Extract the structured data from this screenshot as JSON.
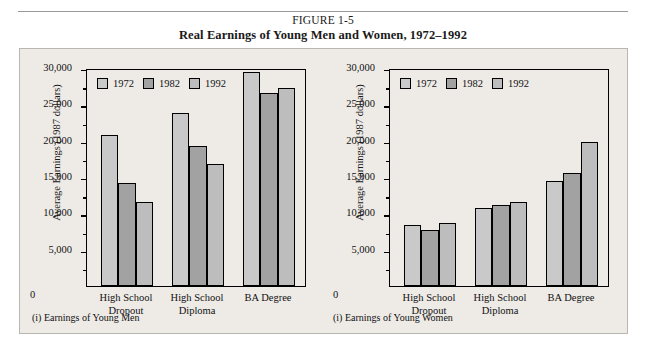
{
  "figure": {
    "number": "FIGURE 1-5",
    "title": "Real Earnings of Young Men and Women, 1972–1992"
  },
  "colors": {
    "panel_background": "#eeebe7",
    "panel_border": "#b9b5b0",
    "series_1972": "#c9c9c9",
    "series_1982": "#a2a2a2",
    "series_1992": "#bdbdbd",
    "axis": "#000000",
    "text": "#111111"
  },
  "axis": {
    "y_label": "Average Earnings (1987 dollars)",
    "zero_label": "0",
    "tick_labels": [
      "30,000",
      "25,000",
      "20,000",
      "15,000",
      "10,000",
      "5,000"
    ],
    "tick_values": [
      30000,
      25000,
      20000,
      15000,
      10000,
      5000
    ],
    "minor_tick_values": [
      27500,
      22500,
      17500,
      12500,
      7500,
      2500
    ]
  },
  "legend": {
    "entries": [
      {
        "label": "1972",
        "color": "#c9c9c9"
      },
      {
        "label": "1982",
        "color": "#a2a2a2"
      },
      {
        "label": "1992",
        "color": "#bdbdbd"
      }
    ]
  },
  "categories": [
    {
      "line1": "High School",
      "line2": "Dropout"
    },
    {
      "line1": "High School",
      "line2": "Diploma"
    },
    {
      "line1": "BA Degree",
      "line2": ""
    }
  ],
  "panels": [
    {
      "id": "men",
      "caption": "(i) Earnings of Young Men"
    },
    {
      "id": "women",
      "caption": "(i) Earnings of Young Women"
    }
  ],
  "chart_data": [
    {
      "type": "bar",
      "title": "(i) Earnings of Young Men",
      "xlabel": "",
      "ylabel": "Average Earnings (1987 dollars)",
      "ylim": [
        0,
        30000
      ],
      "ytick_interval": 5000,
      "grid": false,
      "legend_position": "top-left",
      "categories": [
        "High School Dropout",
        "High School Diploma",
        "BA Degree"
      ],
      "series": [
        {
          "name": "1972",
          "color": "#c9c9c9",
          "values": [
            20800,
            23800,
            29500
          ]
        },
        {
          "name": "1982",
          "color": "#a2a2a2",
          "values": [
            14200,
            19200,
            26600
          ]
        },
        {
          "name": "1992",
          "color": "#bdbdbd",
          "values": [
            11500,
            16800,
            27200
          ]
        }
      ]
    },
    {
      "type": "bar",
      "title": "(i) Earnings of Young Women",
      "xlabel": "",
      "ylabel": "Average Earnings (1987 dollars)",
      "ylim": [
        0,
        30000
      ],
      "ytick_interval": 5000,
      "grid": false,
      "legend_position": "top-left",
      "categories": [
        "High School Dropout",
        "High School Diploma",
        "BA Degree"
      ],
      "series": [
        {
          "name": "1972",
          "color": "#c9c9c9",
          "values": [
            8400,
            10700,
            14500
          ]
        },
        {
          "name": "1982",
          "color": "#a2a2a2",
          "values": [
            7700,
            11200,
            15600
          ]
        },
        {
          "name": "1992",
          "color": "#bdbdbd",
          "values": [
            8700,
            11500,
            19800
          ]
        }
      ]
    }
  ]
}
